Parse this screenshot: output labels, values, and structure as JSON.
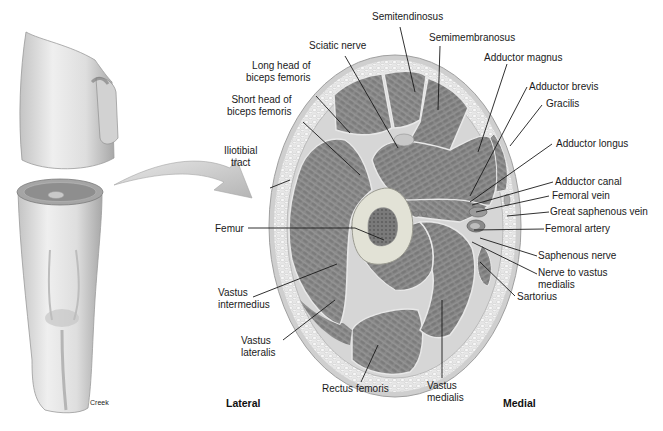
{
  "figure": {
    "orientation": {
      "left": "Lateral",
      "right": "Medial"
    },
    "credit": "Creek",
    "labels_left": [
      {
        "id": "long-head-biceps",
        "line1": "Long head of",
        "line2": "biceps femoris"
      },
      {
        "id": "short-head-biceps",
        "line1": "Short head of",
        "line2": "biceps femoris"
      },
      {
        "id": "iliotibial-tract",
        "line1": "Iliotibial",
        "line2": "tract"
      },
      {
        "id": "femur",
        "line1": "Femur"
      },
      {
        "id": "vastus-intermedius",
        "line1": "Vastus",
        "line2": "intermedius"
      },
      {
        "id": "vastus-lateralis",
        "line1": "Vastus",
        "line2": "lateralis"
      }
    ],
    "labels_top": [
      {
        "id": "semitendinosus",
        "line1": "Semitendinosus"
      },
      {
        "id": "sciatic-nerve",
        "line1": "Sciatic nerve"
      },
      {
        "id": "semimembranosus",
        "line1": "Semimembranosus"
      }
    ],
    "labels_right": [
      {
        "id": "adductor-magnus",
        "line1": "Adductor magnus"
      },
      {
        "id": "adductor-brevis",
        "line1": "Adductor brevis"
      },
      {
        "id": "gracilis",
        "line1": "Gracilis"
      },
      {
        "id": "adductor-longus",
        "line1": "Adductor longus"
      },
      {
        "id": "adductor-canal",
        "line1": "Adductor canal"
      },
      {
        "id": "femoral-vein",
        "line1": "Femoral vein"
      },
      {
        "id": "great-saphenous-vein",
        "line1": "Great saphenous vein"
      },
      {
        "id": "femoral-artery",
        "line1": "Femoral artery"
      },
      {
        "id": "saphenous-nerve",
        "line1": "Saphenous nerve"
      },
      {
        "id": "nerve-to-vastus-medialis",
        "line1": "Nerve to vastus",
        "line2": "medialis"
      },
      {
        "id": "sartorius",
        "line1": "Sartorius"
      }
    ],
    "labels_bottom": [
      {
        "id": "rectus-femoris",
        "line1": "Rectus femoris"
      },
      {
        "id": "vastus-medialis",
        "line1": "Vastus",
        "line2": "medialis"
      }
    ],
    "colors": {
      "muscle": "#8a8a8a",
      "muscle_dark": "#6f6f6f",
      "fascia": "#d9d9d9",
      "fat": "#e9e9e9",
      "skin": "#c9c9c9",
      "bone": "#dcdcd2",
      "marrow": "#7d7d7d",
      "arrow": "#c8c8c8",
      "leader": "#1a1a1a"
    }
  }
}
